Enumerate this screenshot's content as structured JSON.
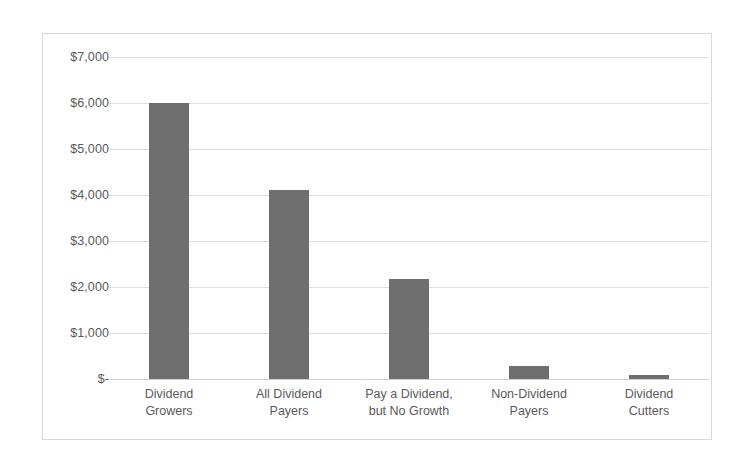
{
  "chart_data": {
    "type": "bar",
    "title": "",
    "subtitle": "",
    "xlabel": "",
    "ylabel": "",
    "categories": [
      "Dividend\nGrowers",
      "All Dividend\nPayers",
      "Pay a Dividend,\nbut No Growth",
      "Non-Dividend\nPayers",
      "Dividend\nCutters"
    ],
    "values": [
      6000,
      4100,
      2180,
      290,
      90
    ],
    "ylim": [
      0,
      7000
    ],
    "ytick_values": [
      7000,
      6000,
      5000,
      4000,
      3000,
      2000,
      1000,
      0
    ],
    "ytick_labels": [
      "$7,000",
      "$6,000",
      "$5,000",
      "$4,000",
      "$3,000",
      "$2,000",
      "$1,000",
      "$-"
    ],
    "grid": true,
    "grid_axis": "y",
    "legend": false,
    "legend_position": "none",
    "series": [
      {
        "name": "Growth of $100",
        "values": [
          6000,
          4100,
          2180,
          290,
          90
        ]
      }
    ],
    "colors": {
      "bar": "#6e6e6e",
      "gridline": "#dedede",
      "baseline": "#cfcfcf",
      "frame_border": "#d9d9d9",
      "tick_text": "#5a5a5a",
      "background": "#ffffff"
    }
  }
}
